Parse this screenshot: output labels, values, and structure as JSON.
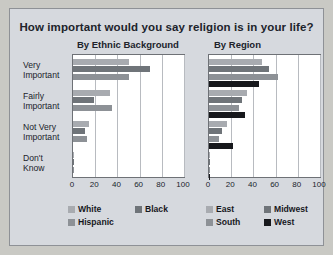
{
  "title": "How important would you say religion is in your life?",
  "panels": [
    {
      "name": "By Ethnic Background"
    },
    {
      "name": "By Region"
    }
  ],
  "categories": [
    "Very Important",
    "Fairly Important",
    "Not Very Important",
    "Don't Know"
  ],
  "category_lines": [
    [
      "Very",
      "Important"
    ],
    [
      "Fairly",
      "Important"
    ],
    [
      "Not Very",
      "Important"
    ],
    [
      "Don't",
      "Know"
    ]
  ],
  "ticks": [
    "0",
    "20",
    "40",
    "60",
    "80",
    "100"
  ],
  "colors": {
    "series_white": "#a8abb0",
    "series_black": "#6f7479",
    "series_hispanic": "#8d9196",
    "series_east": "#a8abb0",
    "series_midwest": "#6f7479",
    "series_south": "#8d9196",
    "series_west": "#17181c",
    "background": "#d6d9de",
    "plot_background": "#ffffff",
    "text": "#20232b"
  },
  "legend_left": [
    {
      "label": "White",
      "color": "#a8abb0"
    },
    {
      "label": "Black",
      "color": "#6f7479"
    },
    {
      "label": "Hispanic",
      "color": "#8d9196"
    }
  ],
  "legend_right": [
    {
      "label": "East",
      "color": "#a8abb0"
    },
    {
      "label": "Midwest",
      "color": "#6f7479"
    },
    {
      "label": "South",
      "color": "#8d9196"
    },
    {
      "label": "West",
      "color": "#17181c"
    }
  ],
  "chart_data": [
    {
      "type": "bar",
      "title": "By Ethnic Background",
      "orientation": "horizontal",
      "categories": [
        "Very Important",
        "Fairly Important",
        "Not Very Important",
        "Don't Know"
      ],
      "series": [
        {
          "name": "White",
          "values": [
            50,
            33,
            14,
            1
          ]
        },
        {
          "name": "Black",
          "values": [
            69,
            19,
            11,
            1
          ]
        },
        {
          "name": "Hispanic",
          "values": [
            50,
            35,
            13,
            1
          ]
        }
      ],
      "xlabel": "",
      "ylabel": "",
      "xlim": [
        0,
        100
      ],
      "xticks": [
        0,
        20,
        40,
        60,
        80,
        100
      ],
      "grid": true,
      "legend_position": "bottom"
    },
    {
      "type": "bar",
      "title": "By Region",
      "orientation": "horizontal",
      "categories": [
        "Very Important",
        "Fairly Important",
        "Not Very Important",
        "Don't Know"
      ],
      "series": [
        {
          "name": "East",
          "values": [
            48,
            34,
            16,
            1
          ]
        },
        {
          "name": "Midwest",
          "values": [
            54,
            30,
            12,
            1
          ]
        },
        {
          "name": "South",
          "values": [
            62,
            27,
            9,
            1
          ]
        },
        {
          "name": "West",
          "values": [
            45,
            32,
            22,
            1
          ]
        }
      ],
      "xlabel": "",
      "ylabel": "",
      "xlim": [
        0,
        100
      ],
      "xticks": [
        0,
        20,
        40,
        60,
        80,
        100
      ],
      "grid": true,
      "legend_position": "bottom"
    }
  ]
}
